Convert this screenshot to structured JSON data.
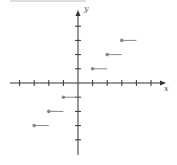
{
  "chart_data": {
    "type": "line",
    "title": "",
    "xlabel": "x",
    "ylabel": "y",
    "xlim": [
      -4,
      5
    ],
    "ylim": [
      -4,
      4
    ],
    "grid": false,
    "segments": [
      {
        "x_start": -3,
        "x_end": -2,
        "y": -3
      },
      {
        "x_start": -2,
        "x_end": -1,
        "y": -2
      },
      {
        "x_start": -1,
        "x_end": 0,
        "y": -1
      },
      {
        "x_start": 0,
        "x_end": 1,
        "y": 0
      },
      {
        "x_start": 1,
        "x_end": 2,
        "y": 1
      },
      {
        "x_start": 2,
        "x_end": 3,
        "y": 2
      },
      {
        "x_start": 3,
        "x_end": 4,
        "y": 3
      }
    ],
    "x_ticks": [
      -4,
      -3,
      -2,
      -1,
      0,
      1,
      2,
      3,
      4,
      5
    ],
    "y_ticks": [
      -4,
      -3,
      -2,
      -1,
      0,
      1,
      2,
      3,
      4
    ]
  },
  "labels": {
    "x_axis": "x",
    "y_axis": "y"
  },
  "colors": {
    "axis": "#333333",
    "point": "#888888",
    "segment": "#888888"
  }
}
